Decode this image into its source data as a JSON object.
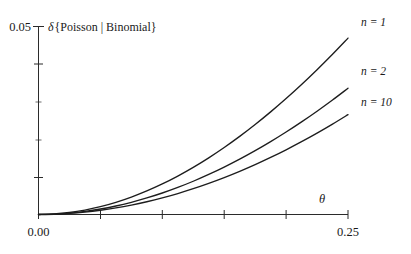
{
  "chart_data": {
    "type": "line",
    "title": "δ{Poisson | Binomial}",
    "xlabel": "θ",
    "ylabel": "",
    "xlim": [
      0.0,
      0.25
    ],
    "ylim": [
      0.0,
      0.05
    ],
    "grid": false,
    "legend_position": "right-outside",
    "x_ticks": [
      {
        "value": 0.0,
        "label": "0.00",
        "type": "major"
      },
      {
        "value": 0.05,
        "label": "",
        "type": "major"
      },
      {
        "value": 0.1,
        "label": "",
        "type": "major"
      },
      {
        "value": 0.15,
        "label": "",
        "type": "major"
      },
      {
        "value": 0.2,
        "label": "",
        "type": "major"
      },
      {
        "value": 0.25,
        "label": "0.25",
        "type": "major"
      }
    ],
    "y_ticks": [
      {
        "value": 0.0,
        "label": "",
        "type": "major"
      },
      {
        "value": 0.01,
        "label": "",
        "type": "major"
      },
      {
        "value": 0.02,
        "label": "",
        "type": "minor"
      },
      {
        "value": 0.03,
        "label": "",
        "type": "minor"
      },
      {
        "value": 0.04,
        "label": "",
        "type": "major"
      },
      {
        "value": 0.05,
        "label": "0.05",
        "type": "major"
      }
    ],
    "x": [
      0.0,
      0.0125,
      0.025,
      0.0375,
      0.05,
      0.0625,
      0.075,
      0.0875,
      0.1,
      0.1125,
      0.125,
      0.1375,
      0.15,
      0.1625,
      0.175,
      0.1875,
      0.2,
      0.2125,
      0.225,
      0.2375,
      0.25
    ],
    "series": [
      {
        "name": "n = 1",
        "legend_label": "n = 1",
        "color": "#1d1d1d",
        "values": [
          0.0,
          0.00013,
          0.00052,
          0.00117,
          0.00207,
          0.00322,
          0.00461,
          0.00624,
          0.0081,
          0.01019,
          0.0125,
          0.01503,
          0.01777,
          0.02072,
          0.02387,
          0.02722,
          0.03076,
          0.03449,
          0.03841,
          0.04251,
          0.04679
        ]
      },
      {
        "name": "n = 2",
        "legend_label": "n = 2",
        "color": "#1d1d1d",
        "values": [
          0.0,
          9e-05,
          0.00037,
          0.00082,
          0.00145,
          0.00226,
          0.00324,
          0.00439,
          0.0057,
          0.00718,
          0.00882,
          0.01062,
          0.01257,
          0.01467,
          0.01693,
          0.01933,
          0.02188,
          0.02457,
          0.0274,
          0.03037,
          0.03348
        ]
      },
      {
        "name": "n = 10",
        "legend_label": "n = 10",
        "color": "#1d1d1d",
        "values": [
          0.0,
          7e-05,
          0.00028,
          0.00063,
          0.00112,
          0.00174,
          0.0025,
          0.00339,
          0.00441,
          0.00556,
          0.00684,
          0.00825,
          0.00978,
          0.01144,
          0.01322,
          0.01513,
          0.01716,
          0.01931,
          0.02158,
          0.02397,
          0.02648
        ]
      }
    ],
    "annotations": [
      {
        "name": "legend-n-1",
        "text": "n = 1"
      },
      {
        "name": "legend-n-2",
        "text": "n = 2"
      },
      {
        "name": "legend-n-10",
        "text": "n = 10"
      }
    ]
  },
  "labels": {
    "title": "δ{Poisson | Binomial}",
    "title_delta": "δ",
    "title_body": "{Poisson | Binomial}",
    "x_axis_symbol": "θ",
    "x_min_label": "0.00",
    "x_max_label": "0.25",
    "y_max_label": "0.05",
    "legend_1": "n = 1",
    "legend_2": "n = 2",
    "legend_3": "n = 10"
  },
  "colors": {
    "axis": "#2b2b2b",
    "curve": "#1d1d1d",
    "background": "#ffffff"
  }
}
